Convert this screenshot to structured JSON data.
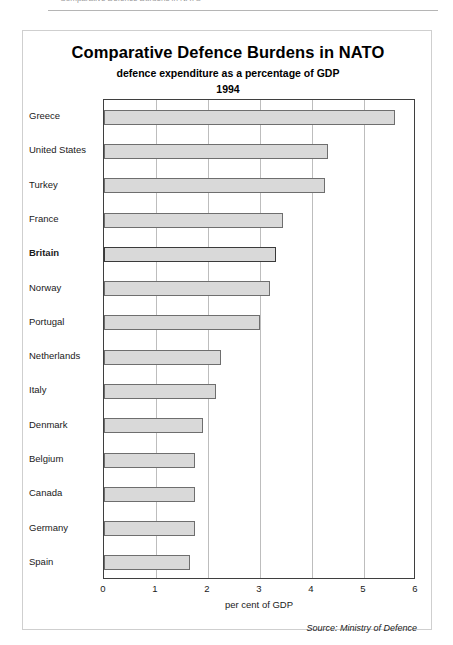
{
  "header_strip": {
    "text": "Comparative Defence Burdens in NATO"
  },
  "chart_data": {
    "type": "bar",
    "orientation": "horizontal",
    "title": "Comparative Defence Burdens in NATO",
    "subtitle": "defence expenditure as a percentage of GDP",
    "year": "1994",
    "xlabel": "per cent of GDP",
    "ylabel": "",
    "xlim": [
      0,
      6
    ],
    "xticks": [
      "0",
      "1",
      "2",
      "3",
      "4",
      "5",
      "6"
    ],
    "grid": true,
    "legend": "none",
    "source": "Source: Ministry of Defence",
    "highlight_category": "Britain",
    "bar_fill": "#d9d9d9",
    "bar_border": "#6e6e6e",
    "categories": [
      "Greece",
      "United States",
      "Turkey",
      "France",
      "Britain",
      "Norway",
      "Portugal",
      "Netherlands",
      "Italy",
      "Denmark",
      "Belgium",
      "Canada",
      "Germany",
      "Spain"
    ],
    "values": [
      5.6,
      4.3,
      4.25,
      3.45,
      3.3,
      3.2,
      3.0,
      2.25,
      2.15,
      1.9,
      1.75,
      1.75,
      1.75,
      1.65
    ]
  }
}
